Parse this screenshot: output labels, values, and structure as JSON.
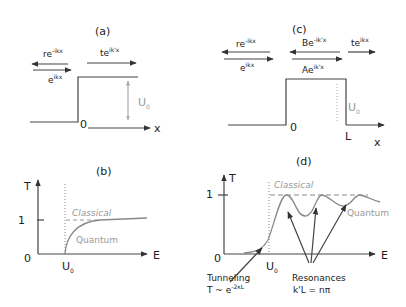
{
  "panels": {
    "a": {
      "label": "(a)",
      "reflected": "re",
      "reflected_exp": "-ikx",
      "incident": "e",
      "incident_exp": "ikx",
      "transmitted": "te",
      "transmitted_exp": "ik'x",
      "origin": "0",
      "barrier": "U",
      "barrier_sub": "0",
      "x_axis": "x"
    },
    "b": {
      "label": "(b)",
      "y_axis": "T",
      "x_axis": "E",
      "y_one": "1",
      "y_zero": "0",
      "x_tick": "U",
      "x_tick_sub": "0",
      "classical": "Classical",
      "quantum": "Quantum"
    },
    "c": {
      "label": "(c)",
      "reflected": "re",
      "reflected_exp": "-ikx",
      "incident": "e",
      "incident_exp": "ikx",
      "backward": "Be",
      "backward_exp": "-ik'x",
      "forward": "Ae",
      "forward_exp": "ik'x",
      "transmitted": "te",
      "transmitted_exp": "ikx",
      "origin": "0",
      "width": "L",
      "barrier": "U",
      "barrier_sub": "0",
      "x_axis": "x"
    },
    "d": {
      "label": "(d)",
      "y_axis": "T",
      "x_axis": "E",
      "y_one": "1",
      "y_zero": "0",
      "x_tick": "U",
      "x_tick_sub": "0",
      "classical": "Classical",
      "quantum": "Quantum",
      "tunneling_title": "Tunneling",
      "tunneling_formula": "T ~ e",
      "tunneling_exp": "-2κL",
      "resonances_title": "Resonances",
      "resonances_formula": "k'L = nπ"
    }
  }
}
